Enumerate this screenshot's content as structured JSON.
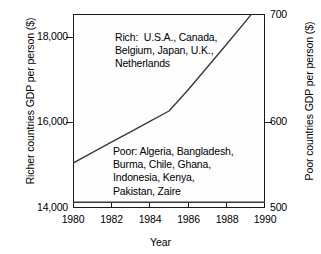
{
  "chart_data": {
    "type": "line",
    "title": "",
    "xlabel": "Year",
    "ylabel": "Richer countries GDP per person ($)",
    "y2label": "Poor countries GDP per person ($)",
    "xlim": [
      1980,
      1990
    ],
    "ylim": [
      14000,
      18100
    ],
    "y2lim": [
      500,
      700
    ],
    "grid": false,
    "legend": "none",
    "xticks": [
      1980,
      1982,
      1984,
      1986,
      1988,
      1990
    ],
    "xticklabels": [
      "1980",
      "1982",
      "1984",
      "1986",
      "1988",
      "1990"
    ],
    "yticks": [
      14000,
      16000,
      18000
    ],
    "yticklabels": [
      "14,000",
      "16,000",
      "18,000"
    ],
    "y2ticks": [
      500,
      600,
      700
    ],
    "y2ticklabels": [
      "500",
      "600",
      "700"
    ],
    "series": [
      {
        "name": "Richer countries GDP per person",
        "axis": "left",
        "x": [
          1980,
          1981,
          1982,
          1983,
          1984,
          1985,
          1986,
          1987,
          1988,
          1989,
          1990
        ],
        "values": [
          14950,
          15170,
          15390,
          15610,
          15830,
          16050,
          16500,
          16980,
          17460,
          17950,
          18450
        ]
      },
      {
        "name": "Poor countries GDP per person",
        "axis": "right",
        "x": [
          1980,
          1982,
          1984,
          1986,
          1988,
          1990
        ],
        "values": [
          506,
          506,
          506,
          506,
          506,
          506
        ]
      }
    ],
    "annotations": [
      {
        "id": "rich",
        "text": "Rich:  U.S.A., Canada,\nBelgium, Japan, U.K.,\nNetherlands"
      },
      {
        "id": "poor",
        "text": "Poor: Algeria, Bangladesh,\nBurma, Chile, Ghana,\nIndonesia, Kenya,\nPakistan, Zaire"
      }
    ],
    "colors": {
      "line": "#3a3a3a",
      "axis": "#1a1a1a",
      "background": "#ffffff",
      "plot_background": "#fdfdfd"
    }
  }
}
